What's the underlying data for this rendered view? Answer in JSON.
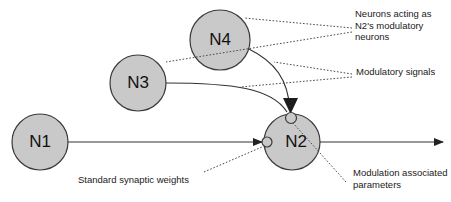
{
  "figure": {
    "type": "diagram",
    "colors": {
      "node_fill": "#c9c9c9",
      "node_stroke": "#3a3a3a",
      "line": "#333333",
      "dotted_leader": "#4a4a4a",
      "text": "#1a1a1a",
      "background": "#ffffff"
    }
  },
  "nodes": [
    {
      "id": "N1",
      "label": "N1",
      "cx": 40,
      "cy": 142,
      "r": 28,
      "role": "presynaptic-neuron"
    },
    {
      "id": "N2",
      "label": "N2",
      "cx": 292,
      "cy": 142,
      "r": 28,
      "role": "modulated-neuron"
    },
    {
      "id": "N3",
      "label": "N3",
      "cx": 138,
      "cy": 83,
      "r": 28,
      "role": "modulatory-neuron"
    },
    {
      "id": "N4",
      "label": "N4",
      "cx": 220,
      "cy": 40,
      "r": 30,
      "role": "modulatory-neuron"
    }
  ],
  "synapse_markers": [
    {
      "id": "standard-synapse",
      "cx": 267,
      "cy": 142,
      "r": 5,
      "on_node": "N2",
      "kind": "standard-synaptic-weight"
    },
    {
      "id": "modulation-site",
      "cx": 291,
      "cy": 118,
      "r": 5,
      "on_node": "N2",
      "kind": "modulation-associated-parameters"
    }
  ],
  "connections": [
    {
      "id": "n1-to-n2",
      "from": "N1",
      "to": "N2",
      "style": "solid-arrow",
      "kind": "standard-synaptic-connection"
    },
    {
      "id": "n3-to-n2",
      "from": "N3",
      "to": "N2",
      "style": "curved-arrow",
      "kind": "modulatory-signal"
    },
    {
      "id": "n4-to-n2",
      "from": "N4",
      "to": "N2",
      "style": "curved-arrow",
      "kind": "modulatory-signal"
    },
    {
      "id": "n2-output",
      "from": "N2",
      "to": "output",
      "style": "solid-arrow",
      "kind": "axon-output"
    }
  ],
  "annotations": {
    "modulatory_neurons": "Neurons acting as\nN2's modulatory\nneurons",
    "modulatory_signals": "Modulatory signals",
    "modulation_parameters": "Modulation associated\nparameters",
    "synaptic_weights": "Standard synaptic weights"
  }
}
